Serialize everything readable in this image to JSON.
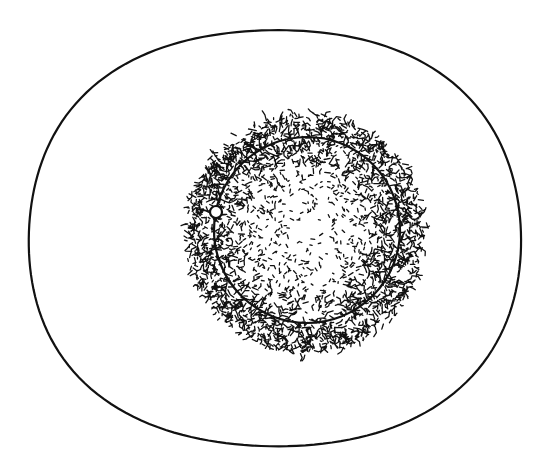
{
  "figure": {
    "type": "line-drawing",
    "background": "#ffffff",
    "ink_color": "#111111",
    "outer_boundary": {
      "shape": "egg-ellipse",
      "center": [
        270,
        232
      ],
      "rx": 246,
      "ry": 208,
      "stroke_width": 2.2
    },
    "stippled_zone": {
      "shape": "circle",
      "center": [
        305,
        234
      ],
      "radius": 120,
      "density_profile": "dense at rim, sparse at center",
      "seed": 7,
      "mark_count": 2600
    },
    "inner_ring": {
      "shape": "circle",
      "center": [
        307,
        230
      ],
      "radius": 93,
      "stroke_width": 2.2
    },
    "marker": {
      "shape": "hollow-circle",
      "center": [
        216,
        212
      ],
      "radius": 6,
      "fill": "#ffffff",
      "stroke_width": 2.2
    }
  }
}
